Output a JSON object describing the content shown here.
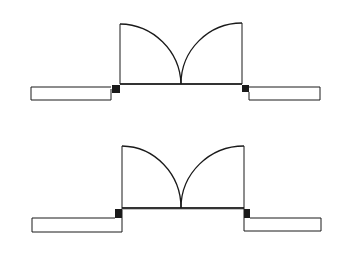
{
  "diagram": {
    "background": "#ffffff",
    "stroke_color": "#1a1a1a",
    "jamb_fill": "#1a1a1a",
    "symbols": [
      {
        "name": "double-door-upper",
        "variant": "offset jamb walls",
        "opening": {
          "x1": 119,
          "x2": 242,
          "y": 84
        },
        "door_leaves": [
          {
            "hinge_x": 119,
            "top_y": 24,
            "arc_end_x": 181
          },
          {
            "hinge_x": 242,
            "top_y": 23,
            "arc_end_x": 181
          }
        ],
        "walls": [
          {
            "side": "left",
            "x": 31,
            "y": 87,
            "w": 80,
            "h": 13
          },
          {
            "side": "right",
            "x": 248,
            "y": 87,
            "w": 72,
            "h": 13
          }
        ]
      },
      {
        "name": "double-door-lower",
        "variant": "flush jamb walls",
        "opening": {
          "x1": 121,
          "x2": 244,
          "y": 208
        },
        "door_leaves": [
          {
            "hinge_x": 121,
            "top_y": 146,
            "arc_end_x": 181
          },
          {
            "hinge_x": 244,
            "top_y": 146,
            "arc_end_x": 181
          }
        ],
        "walls": [
          {
            "side": "left",
            "x": 32,
            "y": 218,
            "w": 89,
            "h": 14
          },
          {
            "side": "right",
            "x": 244,
            "y": 218,
            "w": 77,
            "h": 13
          }
        ]
      }
    ]
  }
}
